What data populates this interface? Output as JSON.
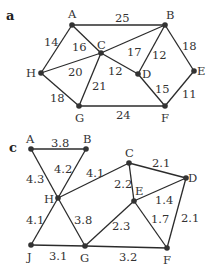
{
  "graphs": [
    {
      "id": "a",
      "label": "a",
      "label_pos": [
        6,
        20
      ],
      "nodes": [
        {
          "id": "A",
          "x": 72,
          "y": 25,
          "lx": 68,
          "ly": 18
        },
        {
          "id": "B",
          "x": 165,
          "y": 25,
          "lx": 166,
          "ly": 19
        },
        {
          "id": "C",
          "x": 101,
          "y": 53,
          "lx": 97,
          "ly": 49
        },
        {
          "id": "H",
          "x": 41,
          "y": 73,
          "lx": 26,
          "ly": 77
        },
        {
          "id": "D",
          "x": 138,
          "y": 74,
          "lx": 142,
          "ly": 78
        },
        {
          "id": "E",
          "x": 194,
          "y": 71,
          "lx": 197,
          "ly": 75
        },
        {
          "id": "G",
          "x": 79,
          "y": 106,
          "lx": 75,
          "ly": 122
        },
        {
          "id": "F",
          "x": 165,
          "y": 106,
          "lx": 161,
          "ly": 122
        }
      ],
      "edges": [
        {
          "from": "A",
          "to": "B",
          "weight": "25",
          "lx": 115,
          "ly": 22
        },
        {
          "from": "A",
          "to": "H",
          "weight": "14",
          "lx": 44,
          "ly": 46
        },
        {
          "from": "A",
          "to": "C",
          "weight": "16",
          "lx": 72,
          "ly": 51
        },
        {
          "from": "H",
          "to": "C",
          "weight": "20",
          "lx": 68,
          "ly": 76
        },
        {
          "from": "C",
          "to": "B",
          "weight": "17",
          "lx": 127,
          "ly": 56
        },
        {
          "from": "C",
          "to": "D",
          "weight": "12",
          "lx": 108,
          "ly": 75
        },
        {
          "from": "C",
          "to": "G",
          "weight": "21",
          "lx": 92,
          "ly": 90
        },
        {
          "from": "B",
          "to": "D",
          "weight": "12",
          "lx": 152,
          "ly": 59
        },
        {
          "from": "B",
          "to": "E",
          "weight": "18",
          "lx": 182,
          "ly": 50
        },
        {
          "from": "D",
          "to": "F",
          "weight": "15",
          "lx": 155,
          "ly": 93
        },
        {
          "from": "E",
          "to": "F",
          "weight": "11",
          "lx": 182,
          "ly": 98
        },
        {
          "from": "H",
          "to": "G",
          "weight": "18",
          "lx": 50,
          "ly": 102
        },
        {
          "from": "G",
          "to": "F",
          "weight": "24",
          "lx": 116,
          "ly": 119
        }
      ]
    },
    {
      "id": "c",
      "label": "c",
      "label_pos": [
        9,
        152
      ],
      "nodes": [
        {
          "id": "A",
          "x": 31,
          "y": 149,
          "lx": 26,
          "ly": 143
        },
        {
          "id": "B",
          "x": 86,
          "y": 149,
          "lx": 83,
          "ly": 143
        },
        {
          "id": "C",
          "x": 129,
          "y": 163,
          "lx": 125,
          "ly": 157
        },
        {
          "id": "D",
          "x": 186,
          "y": 178,
          "lx": 188,
          "ly": 182
        },
        {
          "id": "E",
          "x": 134,
          "y": 201,
          "lx": 135,
          "ly": 195
        },
        {
          "id": "H",
          "x": 58,
          "y": 198,
          "lx": 44,
          "ly": 203
        },
        {
          "id": "J",
          "x": 31,
          "y": 245,
          "lx": 27,
          "ly": 261
        },
        {
          "id": "G",
          "x": 85,
          "y": 246,
          "lx": 80,
          "ly": 262
        },
        {
          "id": "F",
          "x": 167,
          "y": 248,
          "lx": 163,
          "ly": 264
        }
      ],
      "edges": [
        {
          "from": "A",
          "to": "B",
          "weight": "3.8",
          "lx": 51,
          "ly": 147
        },
        {
          "from": "A",
          "to": "H",
          "weight": "4.3",
          "lx": 26,
          "ly": 183
        },
        {
          "from": "B",
          "to": "H",
          "weight": "4.2",
          "lx": 54,
          "ly": 173
        },
        {
          "from": "H",
          "to": "C",
          "weight": "4.1",
          "lx": 86,
          "ly": 177
        },
        {
          "from": "C",
          "to": "D",
          "weight": "2.1",
          "lx": 152,
          "ly": 167
        },
        {
          "from": "C",
          "to": "E",
          "weight": "2.2",
          "lx": 114,
          "ly": 188
        },
        {
          "from": "E",
          "to": "D",
          "weight": "1.4",
          "lx": 155,
          "ly": 204
        },
        {
          "from": "D",
          "to": "F",
          "weight": "2.1",
          "lx": 181,
          "ly": 222
        },
        {
          "from": "E",
          "to": "F",
          "weight": "1.7",
          "lx": 151,
          "ly": 223
        },
        {
          "from": "E",
          "to": "G",
          "weight": "2.3",
          "lx": 112,
          "ly": 230
        },
        {
          "from": "H",
          "to": "G",
          "weight": "3.8",
          "lx": 74,
          "ly": 224
        },
        {
          "from": "H",
          "to": "J",
          "weight": "4.1",
          "lx": 26,
          "ly": 224
        },
        {
          "from": "J",
          "to": "G",
          "weight": "3.1",
          "lx": 49,
          "ly": 260
        },
        {
          "from": "G",
          "to": "F",
          "weight": "3.2",
          "lx": 119,
          "ly": 261
        }
      ]
    }
  ],
  "colors": {
    "edge": "#2b2b2b",
    "node": "#333333",
    "text": "#333333",
    "background": "#ffffff"
  }
}
